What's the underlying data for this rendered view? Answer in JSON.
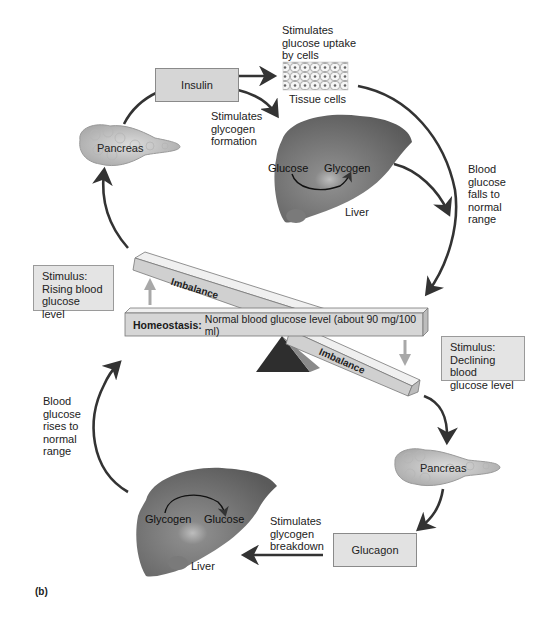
{
  "figure": {
    "panel_label": "(b)"
  },
  "colors": {
    "box_fill": "#d6d6d6",
    "stimulus_fill": "#e4e4e4",
    "arrow_dark": "#333333",
    "arrow_light": "#a8a8a8",
    "liver": "#6e6e6e",
    "pancreas": "#c8c8c8",
    "fulcrum": "#2e2e2e"
  },
  "top_cycle": {
    "hormone": "Insulin",
    "pancreas_label": "Pancreas",
    "uptake_note": "Stimulates\nglucose uptake\nby cells",
    "tissue_label": "Tissue cells",
    "glycogen_note": "Stimulates\nglycogen\nformation",
    "liver": {
      "from": "Glucose",
      "to": "Glycogen",
      "label": "Liver"
    },
    "return_note": "Blood\nglucose\nfalls to\nnormal\nrange"
  },
  "balance": {
    "homeostasis_bold": "Homeostasis:",
    "homeostasis_text": "Normal blood glucose level (about 90 mg/100 ml)",
    "upper_beam": "Imbalance",
    "lower_beam": "Imbalance",
    "stimulus_rising": "Stimulus:\nRising blood\nglucose level",
    "stimulus_declining": "Stimulus:\nDeclining blood\nglucose level"
  },
  "bottom_cycle": {
    "hormone": "Glucagon",
    "pancreas_label": "Pancreas",
    "breakdown_note": "Stimulates\nglycogen\nbreakdown",
    "liver": {
      "from": "Glycogen",
      "to": "Glucose",
      "label": "Liver"
    },
    "return_note": "Blood\nglucose\nrises to\nnormal\nrange"
  }
}
